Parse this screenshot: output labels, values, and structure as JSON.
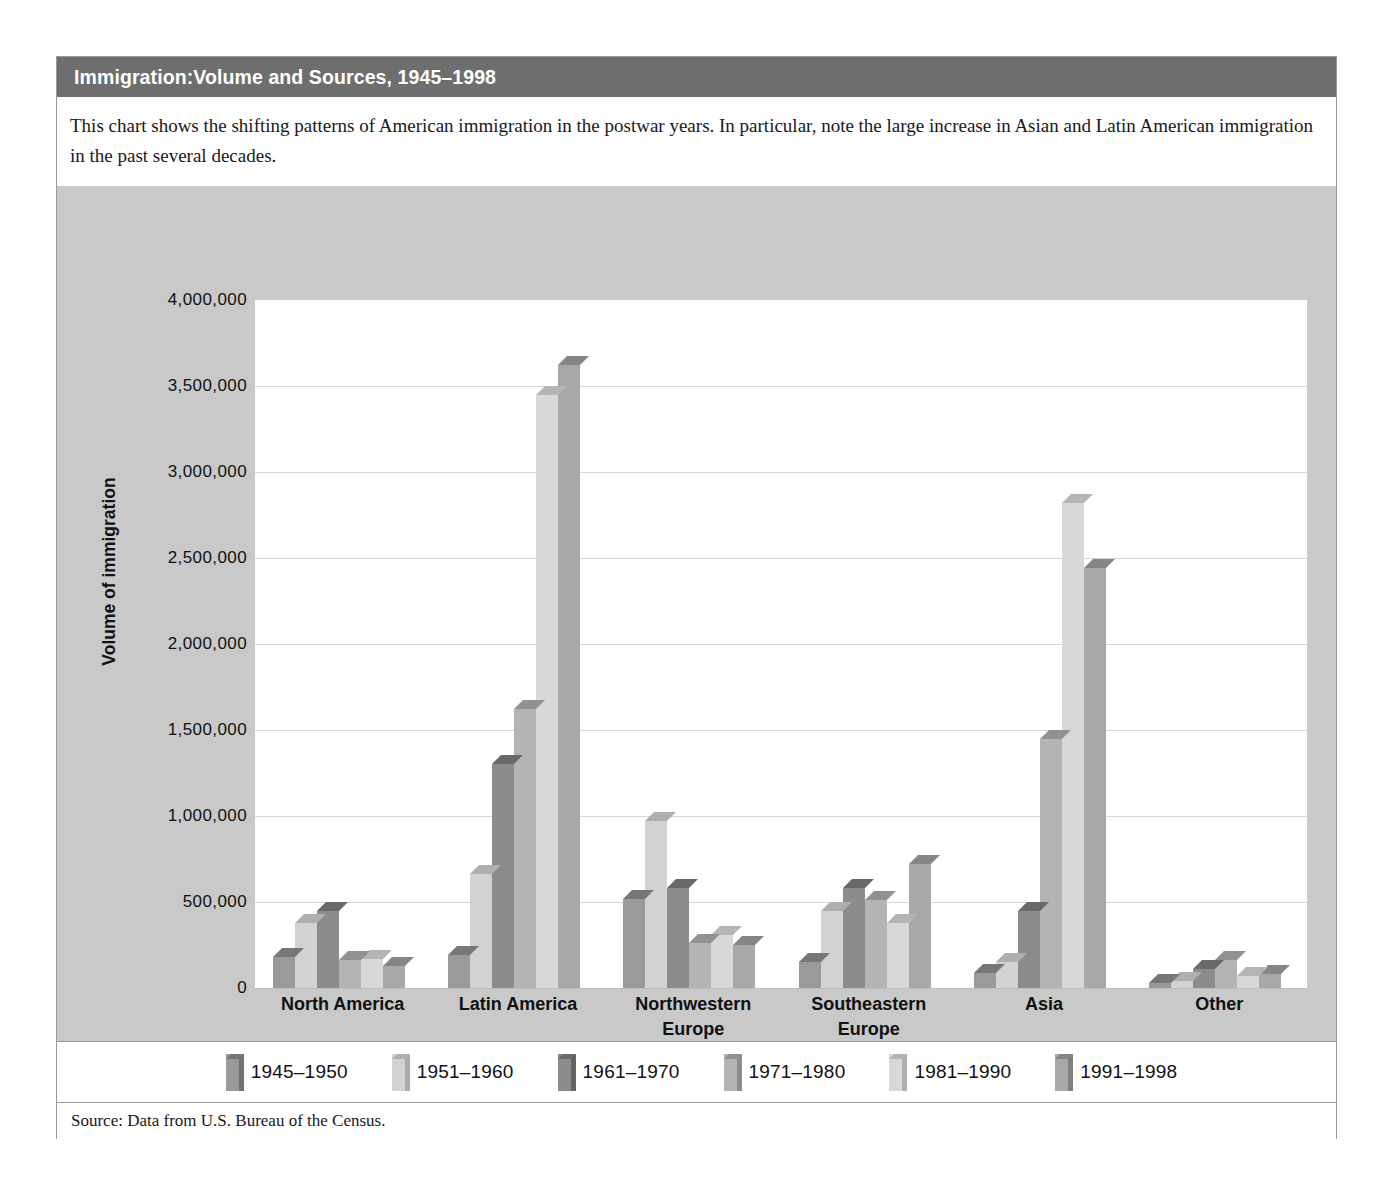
{
  "title": "Immigration:Volume and Sources, 1945–1998",
  "caption": "This chart shows the shifting patterns of American immigration in the postwar years. In particular, note the large increase in Asian and Latin American immigration in the past several decades.",
  "source": "Source: Data from U.S. Bureau of the Census.",
  "colors": {
    "title_bar": "#6e6e6e",
    "panel": "#c9c9c9",
    "plot": "#ffffff",
    "border": "#9a9a9a",
    "series": [
      "#9a9a9a",
      "#d2d2d2",
      "#8c8c8c",
      "#b4b4b4",
      "#d8d8d8",
      "#a8a8a8"
    ]
  },
  "chart_data": {
    "type": "bar",
    "title": "Immigration:Volume and Sources, 1945–1998",
    "xlabel": "",
    "ylabel": "Volume of immigration",
    "ylim": [
      0,
      4000000
    ],
    "ytick_step": 500000,
    "ytick_labels": [
      "4,000,000",
      "3,500,000",
      "3,000,000",
      "2,500,000",
      "2,000,000",
      "1,500,000",
      "1,000,000",
      "500,000",
      "0"
    ],
    "ytick_values": [
      4000000,
      3500000,
      3000000,
      2500000,
      2000000,
      1500000,
      1000000,
      500000,
      0
    ],
    "grid": true,
    "legend_position": "bottom",
    "categories": [
      "North America",
      "Latin America",
      "Northwestern\nEurope",
      "Southeastern\nEurope",
      "Asia",
      "Other"
    ],
    "series": [
      {
        "name": "1945–1950",
        "values": [
          180000,
          190000,
          520000,
          150000,
          90000,
          30000
        ]
      },
      {
        "name": "1951–1960",
        "values": [
          380000,
          660000,
          970000,
          450000,
          150000,
          40000
        ]
      },
      {
        "name": "1961–1970",
        "values": [
          450000,
          1300000,
          580000,
          580000,
          450000,
          110000
        ]
      },
      {
        "name": "1971–1980",
        "values": [
          160000,
          1620000,
          260000,
          510000,
          1450000,
          160000
        ]
      },
      {
        "name": "1981–1990",
        "values": [
          170000,
          3450000,
          310000,
          380000,
          2820000,
          70000
        ]
      },
      {
        "name": "1991–1998",
        "values": [
          130000,
          3620000,
          250000,
          720000,
          2440000,
          80000
        ]
      }
    ]
  }
}
